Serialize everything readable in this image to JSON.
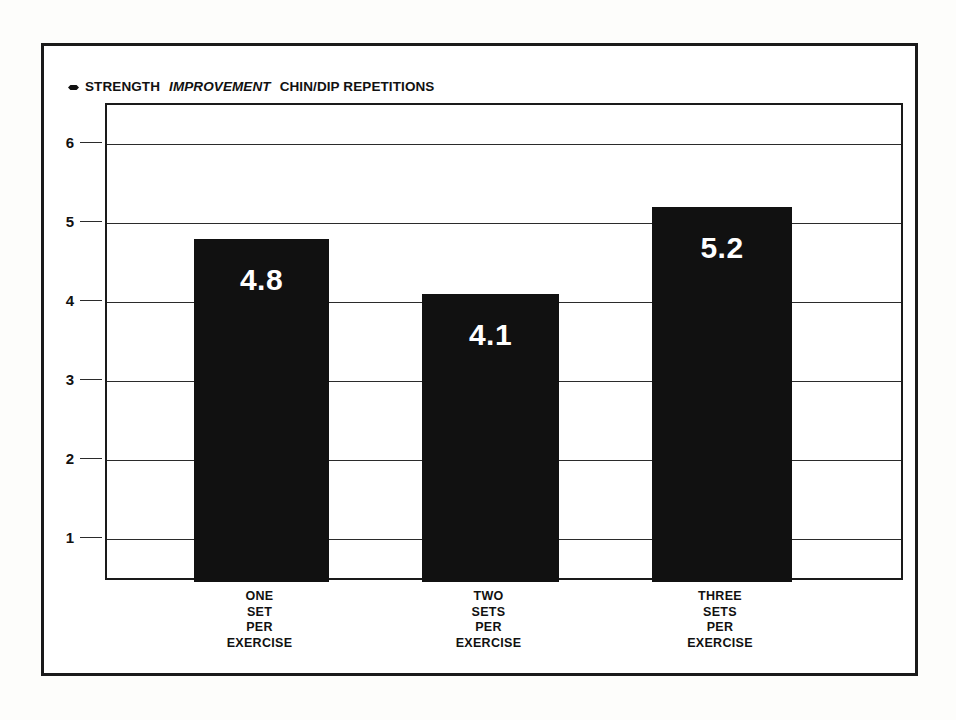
{
  "chart_data": {
    "type": "bar",
    "title": "STRENGTH IMPROVEMENT CHIN/DIP REPETITIONS",
    "title_parts": {
      "bullet": "diamond-bullet",
      "lead": "STRENGTH",
      "italic": "IMPROVEMENT",
      "tail": "CHIN/DIP REPETITIONS"
    },
    "categories": [
      "ONE SET PER EXERCISE",
      "TWO SETS PER EXERCISE",
      "THREE SETS PER EXERCISE"
    ],
    "category_lines": [
      [
        "ONE",
        "SET",
        "PER",
        "EXERCISE"
      ],
      [
        "TWO",
        "SETS",
        "PER",
        "EXERCISE"
      ],
      [
        "THREE",
        "SETS",
        "PER",
        "EXERCISE"
      ]
    ],
    "values": [
      4.8,
      4.1,
      5.2
    ],
    "value_labels": [
      "4.8",
      "4.1",
      "5.2"
    ],
    "xlabel": "",
    "ylabel": "",
    "ylim": [
      0.45,
      6.5
    ],
    "yticks": [
      6,
      5,
      4,
      3,
      2,
      1
    ],
    "ytick_labels": [
      "6",
      "5",
      "4",
      "3",
      "2",
      "1"
    ],
    "grid": true,
    "legend": false,
    "bar_color": "#111111",
    "value_label_color": "#ffffff",
    "axis_color": "#2b2b2b",
    "frame_color": "#1a1a1a",
    "background_color": "#ffffff"
  }
}
